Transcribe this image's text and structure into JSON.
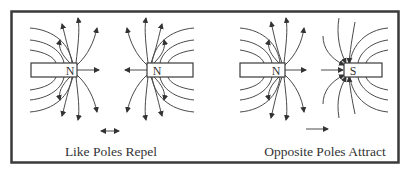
{
  "diagram": {
    "panels": [
      {
        "caption": "Like Poles Repel",
        "magnets": [
          {
            "label": "N",
            "x": 31,
            "y": 63,
            "w": 46,
            "h": 14
          },
          {
            "label": "N",
            "x": 147,
            "y": 63,
            "w": 46,
            "h": 14
          }
        ],
        "motion_indicator": "double-arrow"
      },
      {
        "caption": "Opposite Poles Attract",
        "magnets": [
          {
            "label": "N",
            "x": 240,
            "y": 63,
            "w": 45,
            "h": 14
          },
          {
            "label": "S",
            "x": 344,
            "y": 63,
            "w": 38,
            "h": 14
          }
        ],
        "motion_indicator": "right-arrow"
      }
    ],
    "colors": {
      "line": "#3a3a3a",
      "background": "#ffffff"
    }
  }
}
